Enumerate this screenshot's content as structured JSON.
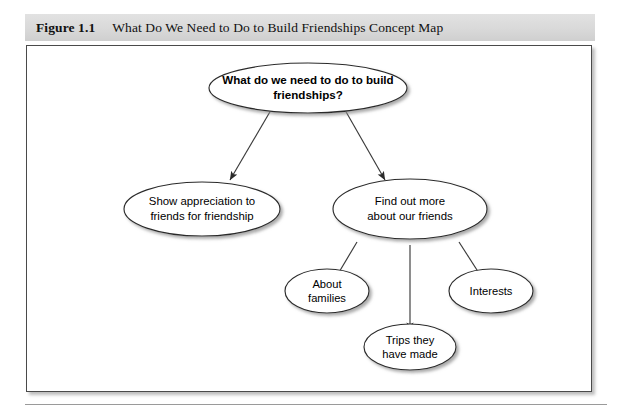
{
  "figure": {
    "label": "Figure 1.1",
    "title": "What Do We Need to Do to Build Friendships Concept Map"
  },
  "concept_map": {
    "root": {
      "id": "root",
      "line1": "What do we need to do to build",
      "line2": "friendships?"
    },
    "branches": [
      {
        "id": "show-appreciation",
        "line1": "Show appreciation to",
        "line2": "friends for friendship"
      },
      {
        "id": "find-out-more",
        "line1": "Find out more",
        "line2": "about our friends"
      }
    ],
    "leaves": [
      {
        "id": "about-families",
        "line1": "About",
        "line2": "families"
      },
      {
        "id": "trips-they-have-made",
        "line1": "Trips they",
        "line2": "have made"
      },
      {
        "id": "interests",
        "line1": "Interests",
        "line2": ""
      }
    ]
  },
  "colors": {
    "caption_band": "#dcdcdc",
    "frame_border": "#4a4a4a",
    "node_stroke": "#2b2b2b",
    "node_fill": "#ffffff",
    "edge": "#3a3a3a",
    "text": "#000000",
    "footer_rule": "#9a9a9a"
  }
}
